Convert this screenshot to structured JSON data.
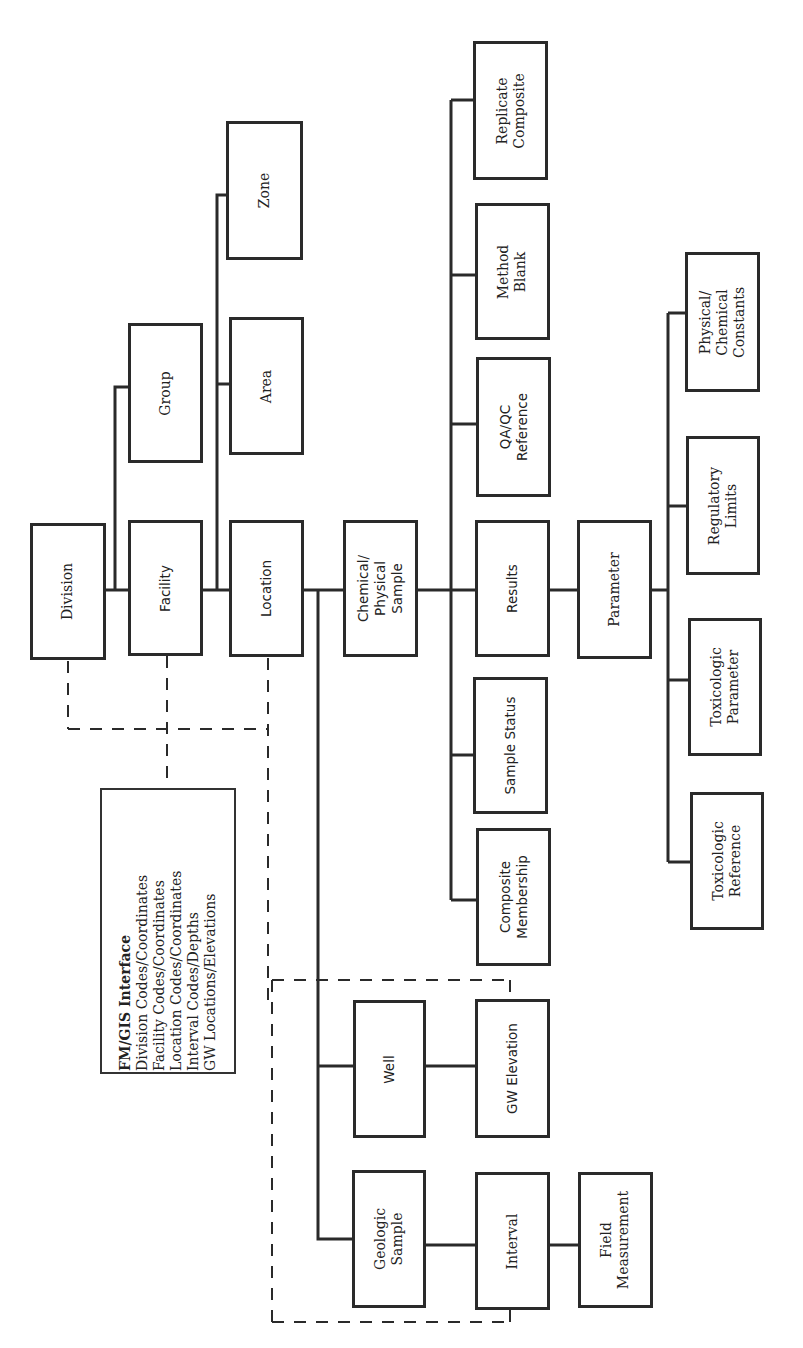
{
  "diagram": {
    "orientation": "rotated -90 degrees",
    "nodes": {
      "division": "Division",
      "facility": "Facility",
      "location": "Location",
      "group": "Group",
      "area": "Area",
      "zone": "Zone",
      "chemical_physical_sample": "Chemical/\nPhysical\nSample",
      "results": "Results",
      "qaqc_reference": "QA/QC\nReference",
      "method_blank": "Method\nBlank",
      "replicate_composite": "Replicate\nComposite",
      "sample_status": "Sample Status",
      "composite_membership": "Composite\nMembership",
      "parameter": "Parameter",
      "physical_chemical_constants": "Physical/\nChemical\nConstants",
      "regulatory_limits": "Regulatory\nLimits",
      "toxicologic_parameter": "Toxicologic\nParameter",
      "toxicologic_reference": "Toxicologic\nReference",
      "well": "Well",
      "gw_elevation": "GW Elevation",
      "geologic_sample": "Geologic\nSample",
      "interval": "Interval",
      "field_measurement": "Field\nMeasurement"
    },
    "legend": {
      "title": "FM/GIS Interface",
      "lines": [
        "Division Codes/Coordinates",
        "Facility  Codes/Coordinates",
        "Location Codes/Coordinates",
        "Interval Codes/Depths",
        "GW Locations/Elevations"
      ]
    },
    "edges": [
      [
        "Division",
        "Facility"
      ],
      [
        "Facility",
        "Group"
      ],
      [
        "Facility",
        "Location"
      ],
      [
        "Location",
        "Area"
      ],
      [
        "Location",
        "Zone"
      ],
      [
        "Location",
        "Chemical/Physical Sample"
      ],
      [
        "Location",
        "Well"
      ],
      [
        "Location",
        "Geologic Sample"
      ],
      [
        "Chemical/Physical Sample",
        "Results"
      ],
      [
        "Chemical/Physical Sample",
        "QA/QC Reference"
      ],
      [
        "Chemical/Physical Sample",
        "Method Blank"
      ],
      [
        "Chemical/Physical Sample",
        "Replicate Composite"
      ],
      [
        "Chemical/Physical Sample",
        "Sample Status"
      ],
      [
        "Chemical/Physical Sample",
        "Composite Membership"
      ],
      [
        "Results",
        "Parameter"
      ],
      [
        "Parameter",
        "Physical/Chemical Constants"
      ],
      [
        "Parameter",
        "Regulatory Limits"
      ],
      [
        "Parameter",
        "Toxicologic Parameter"
      ],
      [
        "Parameter",
        "Toxicologic Reference"
      ],
      [
        "Well",
        "GW Elevation"
      ],
      [
        "Geologic Sample",
        "Interval"
      ],
      [
        "Interval",
        "Field Measurement"
      ]
    ],
    "colors": {
      "line": "#2a2a2a",
      "background": "#ffffff"
    }
  }
}
